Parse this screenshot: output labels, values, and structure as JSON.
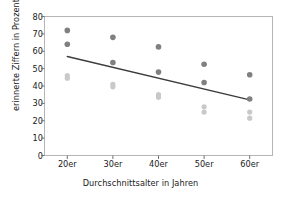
{
  "chart_data": {
    "type": "scatter",
    "title": "",
    "xlabel": "Durchschnittsalter in Jahren",
    "ylabel": "erinnerte Ziffern in Prozent",
    "categories": [
      "20er",
      "30er",
      "40er",
      "50er",
      "60er"
    ],
    "ylim": [
      0,
      80
    ],
    "yticks": [
      0,
      10,
      20,
      30,
      40,
      50,
      60,
      70,
      80
    ],
    "ytick_labels": [
      "0",
      "10",
      "20",
      "30",
      "40",
      "50",
      "60",
      "70",
      "80"
    ],
    "grid": false,
    "legend": "none",
    "series": [
      {
        "name": "dunkle Punkte",
        "color": "#808080",
        "marker": "circle",
        "points": [
          {
            "x": "20er",
            "values": [
              72,
              64
            ]
          },
          {
            "x": "30er",
            "values": [
              68,
              53.5
            ]
          },
          {
            "x": "40er",
            "values": [
              62.5,
              48
            ]
          },
          {
            "x": "50er",
            "values": [
              52.5,
              42
            ]
          },
          {
            "x": "60er",
            "values": [
              46.5,
              32.5
            ]
          }
        ]
      },
      {
        "name": "helle Punkte",
        "color": "#c9c9c9",
        "marker": "circle",
        "points": [
          {
            "x": "20er",
            "values": [
              46,
              44.5
            ]
          },
          {
            "x": "30er",
            "values": [
              41,
              39.5
            ]
          },
          {
            "x": "40er",
            "values": [
              35,
              33.5
            ]
          },
          {
            "x": "50er",
            "values": [
              28,
              25
            ]
          },
          {
            "x": "60er",
            "values": [
              25,
              21.5
            ]
          }
        ]
      },
      {
        "name": "Trendlinie",
        "color": "#3c3c3c",
        "marker": "line",
        "line": {
          "x_start": "20er",
          "y_start": 57,
          "x_end": "60er",
          "y_end": 32
        }
      }
    ]
  },
  "axes": {
    "frame_color": "#b5b5b5",
    "tick_color": "#707070",
    "text_color": "#1a1a1a"
  }
}
